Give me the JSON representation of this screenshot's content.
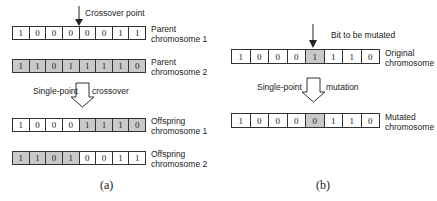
{
  "panel_a": {
    "crossover_point_label": "Crossover point",
    "operation_label_left": "Single-point",
    "operation_label_right": "crossover",
    "caption": "(a)",
    "chromosomes": [
      {
        "name": "Parent chromosome 1",
        "label_line1": "Parent",
        "label_line2": "chromosome 1",
        "bits": [
          "1",
          "0",
          "0",
          "0",
          "0",
          "0",
          "1",
          "1"
        ],
        "shaded": [
          false,
          false,
          false,
          false,
          false,
          false,
          false,
          false
        ]
      },
      {
        "name": "Parent chromosome 2",
        "label_line1": "Parent",
        "label_line2": "chromosome 2",
        "bits": [
          "1",
          "1",
          "0",
          "1",
          "1",
          "1",
          "1",
          "0"
        ],
        "shaded": [
          true,
          true,
          true,
          true,
          true,
          true,
          true,
          true
        ]
      },
      {
        "name": "Offspring chromosome 1",
        "label_line1": "Offspring",
        "label_line2": "chromosome 1",
        "bits": [
          "1",
          "0",
          "0",
          "0",
          "1",
          "1",
          "1",
          "0"
        ],
        "shaded": [
          false,
          false,
          false,
          false,
          true,
          true,
          true,
          true
        ]
      },
      {
        "name": "Offspring chromosome 2",
        "label_line1": "Offspring",
        "label_line2": "chromosome 2",
        "bits": [
          "1",
          "1",
          "0",
          "1",
          "0",
          "0",
          "1",
          "1"
        ],
        "shaded": [
          true,
          true,
          true,
          true,
          false,
          false,
          false,
          false
        ]
      }
    ]
  },
  "panel_b": {
    "mutation_point_label": "Bit to be mutated",
    "operation_label_left": "Single-point",
    "operation_label_right": "mutation",
    "caption": "(b)",
    "chromosomes": [
      {
        "name": "Original chromosome",
        "label_line1": "Original",
        "label_line2": "chromosome",
        "bits": [
          "1",
          "0",
          "0",
          "0",
          "1",
          "1",
          "1",
          "0"
        ],
        "shaded": [
          false,
          false,
          false,
          false,
          true,
          false,
          false,
          false
        ]
      },
      {
        "name": "Mutated chromosome",
        "label_line1": "Mutated",
        "label_line2": "chromosome",
        "bits": [
          "1",
          "0",
          "0",
          "0",
          "0",
          "1",
          "1",
          "0"
        ],
        "shaded": [
          false,
          false,
          false,
          false,
          true,
          false,
          false,
          false
        ]
      }
    ]
  },
  "colors": {
    "shaded_cell": "#c9c9c9",
    "border": "#333333"
  }
}
